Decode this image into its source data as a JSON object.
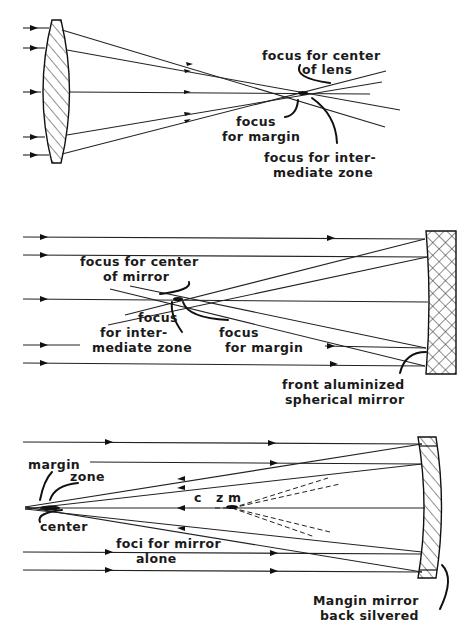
{
  "figure": {
    "panels": [
      {
        "id": "lens",
        "element": "converging lens",
        "labels": {
          "center": "focus for center\nof lens",
          "margin": "focus\nfor margin",
          "intermediate": "focus for inter-\nmediate zone"
        }
      },
      {
        "id": "spherical-mirror",
        "element": "front aluminized spherical mirror",
        "labels": {
          "center": "focus for center\nof mirror",
          "intermediate": "focus\nfor inter-\nmediate zone",
          "margin": "focus\nfor margin",
          "mirror": "front aluminized\nspherical mirror"
        }
      },
      {
        "id": "mangin-mirror",
        "element": "Mangin mirror back silvered",
        "labels": {
          "margin": "margin",
          "zone": "zone",
          "center": "center",
          "c": "c",
          "z": "z",
          "m": "m",
          "foci": "foci for mirror\nalone",
          "mirror": "Mangin mirror\nback silvered"
        }
      }
    ]
  },
  "text": {
    "p1_center_1": "focus for center",
    "p1_center_2": "of lens",
    "p1_margin_1": "focus",
    "p1_margin_2": "for margin",
    "p1_inter_1": "focus for inter-",
    "p1_inter_2": "mediate zone",
    "p2_center_1": "focus for center",
    "p2_center_2": "of mirror",
    "p2_inter_1": "focus",
    "p2_inter_2": "for inter-",
    "p2_inter_3": "mediate zone",
    "p2_margin_1": "focus",
    "p2_margin_2": "for margin",
    "p2_mirror_1": "front aluminized",
    "p2_mirror_2": "spherical mirror",
    "p3_margin": "margin",
    "p3_zone": "zone",
    "p3_center": "center",
    "p3_c": "c",
    "p3_z": "z",
    "p3_m": "m",
    "p3_foci_1": "foci for mirror",
    "p3_foci_2": "alone",
    "p3_mirror_1": "Mangin mirror",
    "p3_mirror_2": "back silvered"
  }
}
